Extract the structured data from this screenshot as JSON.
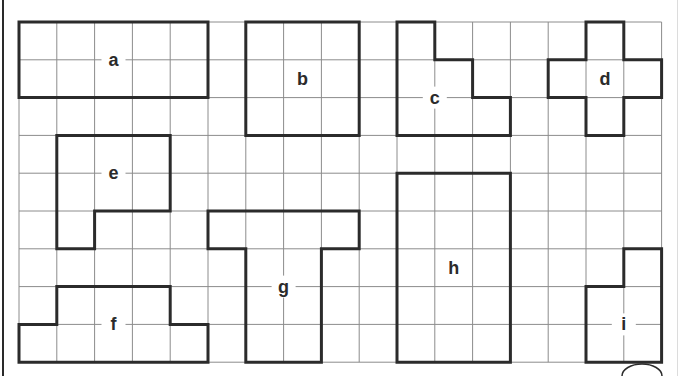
{
  "grid": {
    "columns": 17,
    "rows": 9
  },
  "colors": {
    "grid_line": "#8c8c8c",
    "outline": "#2b2b2b",
    "label": "#2b2b2b",
    "background": "#ffffff"
  },
  "shapes": [
    {
      "id": "a",
      "label": "a",
      "cells_area": 10,
      "vertices": [
        [
          0,
          0
        ],
        [
          5,
          0
        ],
        [
          5,
          2
        ],
        [
          0,
          2
        ]
      ],
      "label_cell": [
        2.5,
        1
      ]
    },
    {
      "id": "b",
      "label": "b",
      "cells_area": 9,
      "vertices": [
        [
          6,
          0
        ],
        [
          9,
          0
        ],
        [
          9,
          3
        ],
        [
          6,
          3
        ]
      ],
      "label_cell": [
        7.5,
        1.5
      ]
    },
    {
      "id": "c",
      "label": "c",
      "cells_area": 6,
      "vertices": [
        [
          10,
          0
        ],
        [
          11,
          0
        ],
        [
          11,
          1
        ],
        [
          12,
          1
        ],
        [
          12,
          2
        ],
        [
          13,
          2
        ],
        [
          13,
          3
        ],
        [
          10,
          3
        ]
      ],
      "label_cell": [
        11,
        2
      ]
    },
    {
      "id": "d",
      "label": "d",
      "cells_area": 5,
      "vertices": [
        [
          15,
          0
        ],
        [
          16,
          0
        ],
        [
          16,
          1
        ],
        [
          17,
          1
        ],
        [
          17,
          2
        ],
        [
          16,
          2
        ],
        [
          16,
          3
        ],
        [
          15,
          3
        ],
        [
          15,
          2
        ],
        [
          14,
          2
        ],
        [
          14,
          1
        ],
        [
          15,
          1
        ]
      ],
      "label_cell": [
        15.5,
        1.5
      ]
    },
    {
      "id": "e",
      "label": "e",
      "cells_area": 7,
      "vertices": [
        [
          1,
          3
        ],
        [
          4,
          3
        ],
        [
          4,
          5
        ],
        [
          2,
          5
        ],
        [
          2,
          6
        ],
        [
          1,
          6
        ]
      ],
      "label_cell": [
        2.5,
        4
      ]
    },
    {
      "id": "f",
      "label": "f",
      "cells_area": 8,
      "vertices": [
        [
          1,
          7
        ],
        [
          4,
          7
        ],
        [
          4,
          8
        ],
        [
          5,
          8
        ],
        [
          5,
          9
        ],
        [
          0,
          9
        ],
        [
          0,
          8
        ],
        [
          1,
          8
        ]
      ],
      "label_cell": [
        2.5,
        8
      ]
    },
    {
      "id": "g",
      "label": "g",
      "cells_area": 10,
      "vertices": [
        [
          5,
          5
        ],
        [
          9,
          5
        ],
        [
          9,
          6
        ],
        [
          8,
          6
        ],
        [
          8,
          9
        ],
        [
          6,
          9
        ],
        [
          6,
          6
        ],
        [
          5,
          6
        ]
      ],
      "label_cell": [
        7,
        7
      ]
    },
    {
      "id": "h",
      "label": "h",
      "cells_area": 15,
      "vertices": [
        [
          10,
          4
        ],
        [
          13,
          4
        ],
        [
          13,
          9
        ],
        [
          10,
          9
        ]
      ],
      "label_cell": [
        11.5,
        6.5
      ]
    },
    {
      "id": "i",
      "label": "i",
      "cells_area": 5,
      "vertices": [
        [
          16,
          6
        ],
        [
          17,
          6
        ],
        [
          17,
          9
        ],
        [
          15,
          9
        ],
        [
          15,
          7
        ],
        [
          16,
          7
        ]
      ],
      "label_cell": [
        16,
        8
      ]
    }
  ]
}
